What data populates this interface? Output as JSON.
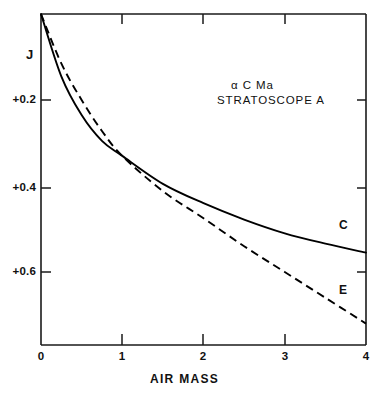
{
  "chart_data": {
    "type": "line",
    "title": "",
    "xlabel": "AIR MASS",
    "ylabel": "J",
    "xlim": [
      0,
      4
    ],
    "ylim": [
      0.0,
      0.78
    ],
    "y_inverted": true,
    "grid": false,
    "legend": "inline-curve-labels",
    "x_ticks": [
      0,
      1,
      2,
      3,
      4
    ],
    "x_tick_labels": [
      "0",
      "1",
      "2",
      "3",
      "4"
    ],
    "y_ticks": [
      0.2,
      0.4,
      0.6
    ],
    "y_tick_labels": [
      "+0.2",
      "+0.4",
      "+0.6"
    ],
    "annotations": [
      "α  C Ma",
      "STRATOSCOPE A"
    ],
    "series": [
      {
        "name": "C",
        "label": "C",
        "style": "solid",
        "color": "#000000",
        "x": [
          0,
          0.25,
          0.5,
          0.75,
          1,
          1.5,
          2,
          2.5,
          3,
          3.5,
          4
        ],
        "values": [
          0.0,
          0.145,
          0.235,
          0.295,
          0.33,
          0.395,
          0.44,
          0.478,
          0.51,
          0.534,
          0.555
        ]
      },
      {
        "name": "E",
        "label": "E",
        "style": "dashed",
        "color": "#000000",
        "x": [
          0,
          0.25,
          0.5,
          0.75,
          1,
          1.5,
          2,
          2.5,
          3,
          3.5,
          4
        ],
        "values": [
          0.0,
          0.115,
          0.2,
          0.272,
          0.33,
          0.412,
          0.475,
          0.54,
          0.6,
          0.66,
          0.72
        ]
      }
    ]
  },
  "axes": {
    "y_title": "J",
    "x_title": "AIR MASS"
  },
  "annotation": {
    "object": "α  C Ma",
    "instrument": "STRATOSCOPE A"
  },
  "curve_labels": {
    "c": "C",
    "e": "E"
  },
  "ticks": {
    "y": [
      "+0.2",
      "+0.4",
      "+0.6"
    ],
    "x": [
      "0",
      "1",
      "2",
      "3",
      "4"
    ]
  }
}
